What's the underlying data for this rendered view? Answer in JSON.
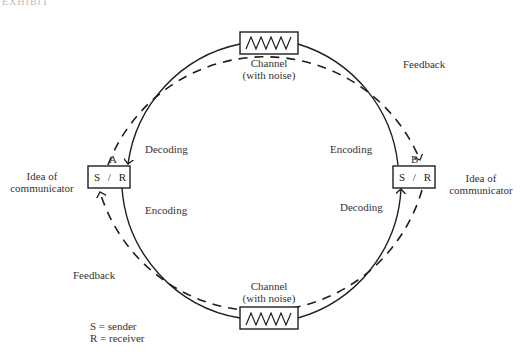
{
  "caption": "EXHIBIT",
  "channel_top": {
    "line1": "Channel",
    "line2": "(with noise)"
  },
  "channel_bottom": {
    "line1": "Channel",
    "line2": "(with noise)"
  },
  "node_a": {
    "label": "A",
    "sender": "S",
    "slash": "/",
    "receiver": "R",
    "idea_line1": "Idea of",
    "idea_line2": "communicator"
  },
  "node_b": {
    "label": "B",
    "sender": "S",
    "slash": "/",
    "receiver": "R",
    "idea_line1": "Idea of",
    "idea_line2": "communicator"
  },
  "labels": {
    "decoding_a": "Decoding",
    "encoding_a": "Encoding",
    "encoding_b": "Encoding",
    "decoding_b": "Decoding",
    "feedback_top": "Feedback",
    "feedback_bottom": "Feedback"
  },
  "legend": {
    "line1": "S = sender",
    "line2": "R = receiver"
  },
  "colors": {
    "line": "#1e1e1e",
    "text": "#333333",
    "background": "#ffffff"
  }
}
